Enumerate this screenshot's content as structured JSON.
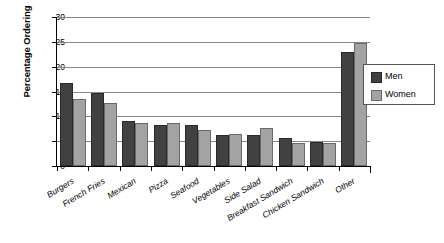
{
  "chart_data": {
    "type": "bar",
    "title": "",
    "subtitle": "",
    "xlabel": "",
    "ylabel": "Percentage Ordering",
    "ylim": [
      0,
      30
    ],
    "ytick_step": 5,
    "yticks": [
      0,
      5,
      10,
      15,
      20,
      25,
      30
    ],
    "ytick_labels": [
      "0",
      "5",
      "10",
      "15",
      "20",
      "25",
      "30"
    ],
    "grid": true,
    "grid_axis": "y",
    "legend_position": "right",
    "categories": [
      "Burgers",
      "French Fries",
      "Mexican",
      "Pizza",
      "Seafood",
      "Vegetables",
      "Side Salad",
      "Breakfast Sandwich",
      "Chicken Sandwich",
      "Other"
    ],
    "series": [
      {
        "name": "Men",
        "color": "#414141",
        "values": [
          16.8,
          14.7,
          9.0,
          8.3,
          8.2,
          6.2,
          6.2,
          5.7,
          4.8,
          23.0
        ]
      },
      {
        "name": "Women",
        "color": "#a3a3a3",
        "values": [
          13.5,
          12.7,
          8.7,
          8.7,
          7.3,
          6.4,
          7.7,
          4.6,
          4.7,
          24.7
        ]
      }
    ]
  },
  "legend": {
    "entries": [
      {
        "label": "Men"
      },
      {
        "label": "Women"
      }
    ]
  },
  "colors": {
    "men": "#414141",
    "women": "#a3a3a3",
    "axis": "#000000",
    "gridline": "#888888",
    "background": "#ffffff"
  }
}
